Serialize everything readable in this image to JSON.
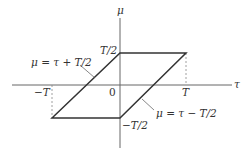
{
  "diagram": {
    "axes": {
      "x_label": "τ",
      "y_label": "μ",
      "origin_label": "0"
    },
    "ticks": {
      "top": "T/2",
      "bottom": "−T/2",
      "left": "−T",
      "right": "T"
    },
    "annotations": {
      "upper_line": "μ = τ + T/2",
      "lower_line": "μ = τ − T/2"
    },
    "colors": {
      "line": "#333333",
      "axis": "#555555",
      "dashed": "#777777"
    }
  }
}
